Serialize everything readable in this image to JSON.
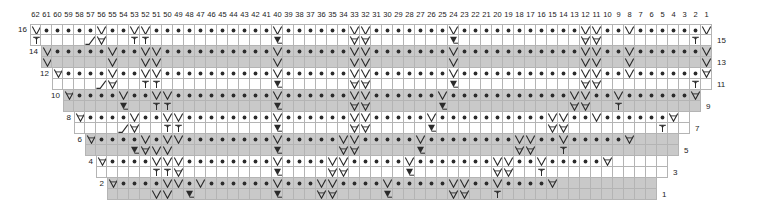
{
  "chart_data": {
    "type": "table",
    "title": "",
    "xlabel": "",
    "ylabel": "",
    "grid": true,
    "legend_position": "none",
    "orientation": "right-to-left",
    "total_columns": 62,
    "total_rows": 16,
    "column_numbers": [
      62,
      61,
      60,
      59,
      58,
      57,
      56,
      55,
      54,
      53,
      52,
      51,
      50,
      49,
      48,
      47,
      46,
      45,
      44,
      43,
      42,
      41,
      40,
      39,
      38,
      37,
      36,
      35,
      34,
      33,
      32,
      31,
      30,
      29,
      28,
      27,
      26,
      25,
      24,
      23,
      22,
      21,
      20,
      19,
      18,
      17,
      16,
      15,
      14,
      13,
      12,
      11,
      10,
      9,
      8,
      7,
      6,
      5,
      4,
      3,
      2,
      1
    ],
    "left_row_numbers": [
      16,
      14,
      12,
      10,
      8,
      6,
      4,
      2
    ],
    "right_row_numbers": [
      15,
      13,
      11,
      9,
      7,
      5,
      3,
      1
    ],
    "row_band_colors": [
      "#ffffff",
      "#c9c9c9"
    ],
    "grid_line_color": "#b4b4b4",
    "symbol_color": "#2b2b2b",
    "symbols": {
      "purl": "•",
      "slip-v": "V",
      "twisted-v": "⊻",
      "twisted-t": "ᳬ",
      "cable-left": "╱",
      "cable-right": "╲"
    },
    "symbol_names": {
      "purl": "purl-dot",
      "slip-v": "slip-stitch-v",
      "twisted-v": "twisted-v-bar",
      "twisted-t": "twisted-t-stitch",
      "cable-left": "cable-cross-left",
      "cable-right": "cable-cross-right"
    },
    "rows": [
      {
        "row_left": 16,
        "row_right": 15,
        "start_col": 62,
        "end_col": 1,
        "band": "white",
        "upper": [
          "V",
          "d",
          "d",
          "d",
          "d",
          "d",
          "V",
          "d",
          "d",
          "V",
          "V",
          "d",
          "d",
          "d",
          "d",
          "d",
          "d",
          "d",
          "d",
          "d",
          "d",
          "d",
          "V",
          "d",
          "d",
          "d",
          "d",
          "d",
          "d",
          "V",
          "V",
          "d",
          "d",
          "d",
          "d",
          "d",
          "d",
          "d",
          "V",
          "d",
          "d",
          "d",
          "d",
          "d",
          "d",
          "d",
          "d",
          "d",
          "d",
          "d",
          "V",
          "V",
          "d",
          "d",
          "V",
          "d",
          "d",
          "d",
          "d",
          "d",
          "d",
          "V"
        ],
        "lower": [
          "t",
          "",
          "",
          "",
          "",
          "c",
          "x",
          "",
          "",
          "t",
          "t",
          "",
          "",
          "",
          "",
          "",
          "",
          "",
          "",
          "",
          "",
          "",
          "w",
          "",
          "",
          "",
          "",
          "",
          "",
          "x",
          "x",
          "",
          "",
          "",
          "",
          "",
          "",
          "",
          "w",
          "",
          "",
          "",
          "",
          "",
          "",
          "",
          "",
          "",
          "",
          "",
          "x",
          "x",
          "",
          "",
          "",
          "",
          "",
          "",
          "",
          "",
          "t",
          ""
        ]
      },
      {
        "row_left": 14,
        "row_right": 13,
        "start_col": 61,
        "end_col": 1,
        "band": "gray",
        "upper": [
          "V",
          "d",
          "d",
          "d",
          "d",
          "d",
          "V",
          "d",
          "d",
          "V",
          "V",
          "d",
          "d",
          "d",
          "d",
          "d",
          "d",
          "d",
          "d",
          "d",
          "d",
          "V",
          "d",
          "d",
          "d",
          "d",
          "d",
          "d",
          "V",
          "V",
          "d",
          "d",
          "d",
          "d",
          "d",
          "d",
          "d",
          "V",
          "d",
          "d",
          "d",
          "d",
          "d",
          "d",
          "d",
          "d",
          "d",
          "d",
          "d",
          "V",
          "V",
          "d",
          "d",
          "V",
          "d",
          "d",
          "d",
          "d",
          "d",
          "d",
          "V"
        ],
        "lower": [
          "V",
          "",
          "",
          "",
          "",
          "",
          "V",
          "",
          "",
          "V",
          "V",
          "",
          "",
          "",
          "",
          "",
          "",
          "",
          "",
          "",
          "",
          "V",
          "",
          "",
          "",
          "",
          "",
          "",
          "V",
          "V",
          "",
          "",
          "",
          "",
          "",
          "",
          "",
          "V",
          "",
          "",
          "",
          "",
          "",
          "",
          "",
          "",
          "",
          "",
          "",
          "V",
          "V",
          "",
          "",
          "V",
          "",
          "",
          "",
          "",
          "",
          "",
          "V"
        ]
      },
      {
        "row_left": 12,
        "row_right": 11,
        "start_col": 60,
        "end_col": 1,
        "band": "white",
        "upper": [
          "x",
          "d",
          "d",
          "d",
          "d",
          "V",
          "d",
          "d",
          "V",
          "V",
          "d",
          "d",
          "d",
          "d",
          "d",
          "d",
          "d",
          "d",
          "d",
          "d",
          "V",
          "d",
          "d",
          "d",
          "d",
          "d",
          "d",
          "V",
          "V",
          "d",
          "d",
          "d",
          "d",
          "d",
          "d",
          "d",
          "V",
          "d",
          "d",
          "d",
          "d",
          "d",
          "d",
          "d",
          "d",
          "d",
          "d",
          "d",
          "V",
          "V",
          "d",
          "d",
          "V",
          "d",
          "d",
          "d",
          "d",
          "d",
          "d",
          "x"
        ],
        "lower": [
          "",
          "",
          "",
          "",
          "c",
          "x",
          "",
          "",
          "t",
          "t",
          "",
          "",
          "",
          "",
          "",
          "",
          "",
          "",
          "",
          "",
          "w",
          "",
          "",
          "",
          "",
          "",
          "",
          "x",
          "x",
          "",
          "",
          "",
          "",
          "",
          "",
          "",
          "w",
          "",
          "",
          "",
          "",
          "",
          "",
          "",
          "",
          "",
          "",
          "",
          "x",
          "x",
          "",
          "",
          "",
          "",
          "",
          "",
          "",
          "",
          "t",
          ""
        ]
      },
      {
        "row_left": 10,
        "row_right": 9,
        "start_col": 59,
        "end_col": 2,
        "band": "gray",
        "upper": [
          "x",
          "d",
          "d",
          "d",
          "d",
          "V",
          "d",
          "d",
          "V",
          "V",
          "d",
          "d",
          "d",
          "d",
          "d",
          "d",
          "d",
          "d",
          "d",
          "V",
          "d",
          "d",
          "d",
          "d",
          "d",
          "d",
          "V",
          "V",
          "d",
          "d",
          "d",
          "d",
          "d",
          "d",
          "V",
          "d",
          "d",
          "d",
          "d",
          "d",
          "d",
          "d",
          "d",
          "d",
          "d",
          "d",
          "V",
          "V",
          "d",
          "d",
          "V",
          "d",
          "d",
          "d",
          "d",
          "d",
          "d",
          "x"
        ],
        "lower": [
          "",
          "",
          "",
          "",
          "",
          "w",
          "",
          "",
          "t",
          "t",
          "",
          "",
          "",
          "",
          "",
          "",
          "",
          "",
          "",
          "w",
          "",
          "",
          "",
          "",
          "",
          "",
          "x",
          "x",
          "",
          "",
          "",
          "",
          "",
          "",
          "w",
          "",
          "",
          "",
          "",
          "",
          "",
          "",
          "",
          "",
          "",
          "",
          "x",
          "x",
          "",
          "",
          "t",
          "",
          "",
          "",
          "",
          "",
          "",
          ""
        ]
      },
      {
        "row_left": 8,
        "row_right": 7,
        "start_col": 58,
        "end_col": 3,
        "band": "white",
        "upper": [
          "x",
          "d",
          "d",
          "d",
          "d",
          "V",
          "d",
          "d",
          "V",
          "V",
          "d",
          "d",
          "d",
          "d",
          "d",
          "d",
          "d",
          "d",
          "V",
          "d",
          "d",
          "d",
          "d",
          "d",
          "d",
          "V",
          "V",
          "d",
          "d",
          "d",
          "d",
          "d",
          "V",
          "d",
          "d",
          "d",
          "d",
          "d",
          "d",
          "d",
          "d",
          "d",
          "d",
          "V",
          "V",
          "d",
          "d",
          "V",
          "d",
          "d",
          "d",
          "d",
          "d",
          "d",
          "x"
        ],
        "lower": [
          "",
          "",
          "",
          "",
          "c",
          "x",
          "",
          "",
          "t",
          "t",
          "",
          "",
          "",
          "",
          "",
          "",
          "",
          "",
          "w",
          "",
          "",
          "",
          "",
          "",
          "",
          "x",
          "x",
          "",
          "",
          "",
          "",
          "",
          "w",
          "",
          "",
          "",
          "",
          "",
          "",
          "",
          "",
          "",
          "",
          "x",
          "x",
          "",
          "",
          "",
          "",
          "",
          "",
          "",
          "",
          "t",
          ""
        ]
      },
      {
        "row_left": 6,
        "row_right": 5,
        "start_col": 57,
        "end_col": 4,
        "band": "gray",
        "upper": [
          "x",
          "d",
          "d",
          "d",
          "d",
          "V",
          "d",
          "V",
          "V",
          "d",
          "d",
          "d",
          "d",
          "d",
          "d",
          "d",
          "d",
          "V",
          "d",
          "d",
          "d",
          "d",
          "d",
          "V",
          "V",
          "d",
          "d",
          "d",
          "d",
          "d",
          "V",
          "d",
          "d",
          "d",
          "d",
          "d",
          "d",
          "d",
          "d",
          "V",
          "V",
          "d",
          "d",
          "V",
          "d",
          "d",
          "d",
          "d",
          "d",
          "x"
        ],
        "lower": [
          "",
          "",
          "",
          "",
          "w",
          "x",
          "V",
          "V",
          "",
          "",
          "",
          "",
          "",
          "",
          "",
          "",
          "",
          "w",
          "",
          "",
          "",
          "",
          "",
          "x",
          "x",
          "",
          "",
          "",
          "",
          "",
          "w",
          "",
          "",
          "",
          "",
          "",
          "",
          "",
          "",
          "x",
          "x",
          "",
          "",
          "t",
          "",
          "",
          "",
          "",
          "",
          "",
          ""
        ]
      },
      {
        "row_left": 4,
        "row_right": 3,
        "start_col": 56,
        "end_col": 5,
        "band": "white",
        "upper": [
          "x",
          "d",
          "d",
          "d",
          "d",
          "V",
          "V",
          "V",
          "d",
          "d",
          "d",
          "d",
          "d",
          "d",
          "d",
          "d",
          "V",
          "d",
          "d",
          "d",
          "d",
          "V",
          "V",
          "d",
          "d",
          "d",
          "d",
          "d",
          "V",
          "d",
          "d",
          "d",
          "d",
          "d",
          "d",
          "d",
          "V",
          "V",
          "d",
          "d",
          "V",
          "d",
          "d",
          "d",
          "d",
          "d",
          "x"
        ],
        "lower": [
          "",
          "",
          "",
          "",
          "",
          "t",
          "t",
          "x",
          "",
          "",
          "",
          "",
          "",
          "",
          "",
          "",
          "w",
          "",
          "",
          "",
          "",
          "x",
          "x",
          "",
          "",
          "",
          "",
          "",
          "w",
          "",
          "",
          "",
          "",
          "",
          "",
          "",
          "x",
          "x",
          "",
          "",
          "t",
          "",
          "",
          "",
          "",
          "",
          ""
        ]
      },
      {
        "row_left": 2,
        "row_right": 1,
        "start_col": 55,
        "end_col": 6,
        "band": "gray",
        "upper": [
          "x",
          "d",
          "d",
          "d",
          "d",
          "V",
          "V",
          "d",
          "V",
          "d",
          "d",
          "d",
          "d",
          "d",
          "d",
          "V",
          "d",
          "d",
          "d",
          "V",
          "V",
          "d",
          "d",
          "d",
          "d",
          "V",
          "d",
          "d",
          "d",
          "d",
          "d",
          "V",
          "V",
          "d",
          "d",
          "V",
          "d",
          "d",
          "d",
          "d",
          "x"
        ],
        "lower": [
          "",
          "",
          "",
          "",
          "V",
          "V",
          "",
          "w",
          "",
          "",
          "",
          "",
          "",
          "",
          "",
          "w",
          "",
          "",
          "",
          "x",
          "x",
          "",
          "",
          "",
          "",
          "w",
          "",
          "",
          "",
          "",
          "",
          "x",
          "x",
          "",
          "",
          "t",
          "",
          "",
          "",
          "",
          ""
        ]
      }
    ]
  }
}
